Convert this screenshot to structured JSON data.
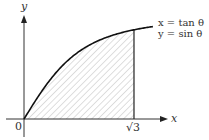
{
  "diagram": {
    "type": "parametric-curve-area",
    "axes": {
      "x_label": "x",
      "y_label": "y",
      "origin_label": "0"
    },
    "curve": {
      "equation_x": "x = tan θ",
      "equation_y": "y = sin θ",
      "color": "#111111"
    },
    "shaded_region": {
      "from_label": "0",
      "to_label": "√3",
      "hatch": "diagonal",
      "hatch_color": "#b8b8b8"
    },
    "tick_labels": [
      "0",
      "√3"
    ]
  }
}
